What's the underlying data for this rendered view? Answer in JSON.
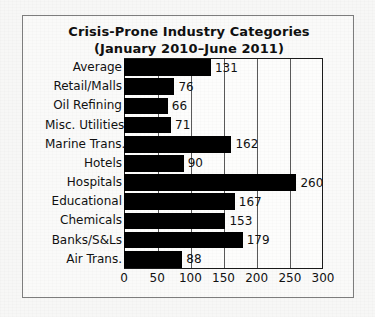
{
  "chart_data": {
    "type": "bar",
    "orientation": "horizontal",
    "title": "Crisis-Prone Industry Categories",
    "subtitle": "(January 2010–June 2011)",
    "xlabel": "",
    "ylabel": "",
    "xlim": [
      0,
      300
    ],
    "xticks": [
      0,
      50,
      100,
      150,
      200,
      250,
      300
    ],
    "grid": true,
    "legend": "none",
    "bar_color": "#000000",
    "categories": [
      "Average",
      "Retail/Malls",
      "Oil Refining",
      "Misc. Utilities",
      "Marine Trans.",
      "Hotels",
      "Hospitals",
      "Educational",
      "Chemicals",
      "Banks/S&Ls",
      "Air Trans."
    ],
    "values": [
      131,
      76,
      66,
      71,
      162,
      90,
      260,
      167,
      153,
      179,
      88
    ],
    "data_labels": [
      "131",
      "76",
      "66",
      "71",
      "162",
      "90",
      "260",
      "167",
      "153",
      "179",
      "88"
    ]
  }
}
